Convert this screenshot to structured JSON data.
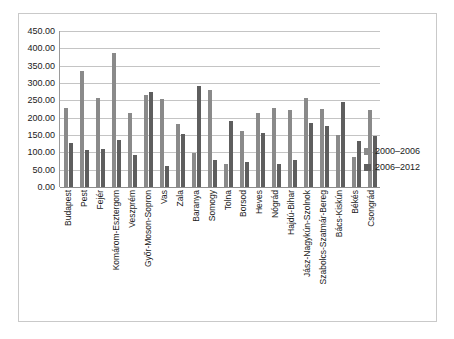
{
  "chart_data": {
    "type": "bar",
    "title": "",
    "xlabel": "",
    "ylabel": "",
    "ylim": [
      0,
      450
    ],
    "ytick_step": 50,
    "grid": true,
    "legend_position": "right",
    "ytick_labels": [
      "450.00",
      "400.00",
      "350.00",
      "300.00",
      "250.00",
      "200.00",
      "150.00",
      "100.00",
      "50.00",
      "0.00"
    ],
    "categories": [
      "Budapest",
      "Pest",
      "Fejér",
      "Komárom-Esztergom",
      "Veszprém",
      "Győr-Moson-Sopron",
      "Vas",
      "Zala",
      "Baranya",
      "Somogy",
      "Tolna",
      "Borsod",
      "Heves",
      "Nógrád",
      "Hajdú-Bihar",
      "Jász-Nagykún-Szolnok",
      "Szabolcs-Szatmár-Bereg",
      "Bács-Kiskún",
      "Békés",
      "Csongrád"
    ],
    "series": [
      {
        "name": "2000–2006",
        "color": "#8a8a8a",
        "values": [
          228,
          334,
          257,
          386,
          213,
          266,
          253,
          181,
          99,
          279,
          66,
          161,
          214,
          228,
          222,
          257,
          226,
          150,
          87,
          223
        ]
      },
      {
        "name": "2006–2012",
        "color": "#5e5e5e",
        "values": [
          127,
          108,
          109,
          136,
          93,
          273,
          61,
          154,
          290,
          79,
          190,
          72,
          157,
          65,
          78,
          184,
          176,
          245,
          134,
          147
        ]
      }
    ]
  },
  "legend": {
    "items": [
      {
        "label": "2000–2006"
      },
      {
        "label": "2006–2012"
      }
    ]
  }
}
